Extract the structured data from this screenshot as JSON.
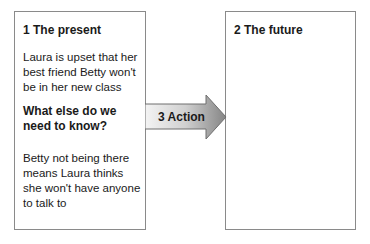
{
  "diagram": {
    "boxes": [
      {
        "title": "1  The present",
        "paragraphs": [
          "Laura is upset that her best friend Betty won't be in her new class",
          "What else do we need to know?",
          "Betty not being there means Laura thinks she won't have anyone to talk to"
        ]
      },
      {
        "title": "2  The future",
        "paragraphs": []
      }
    ],
    "arrow": {
      "label": "3  Action",
      "colors": {
        "light": "#f2f2f2",
        "dark": "#8c8c8c",
        "border": "#6e6e6e"
      }
    }
  }
}
